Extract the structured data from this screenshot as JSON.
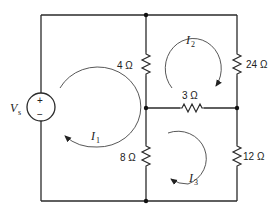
{
  "diagram": {
    "type": "circuit",
    "source": {
      "label": "V",
      "subscript": "s",
      "plus": "+",
      "minus": "−"
    },
    "resistors": [
      {
        "id": "R4",
        "label": "4 Ω",
        "branch": "left-middle-top"
      },
      {
        "id": "R24",
        "label": "24 Ω",
        "branch": "right-top"
      },
      {
        "id": "R3",
        "label": "3 Ω",
        "branch": "middle-horizontal"
      },
      {
        "id": "R8",
        "label": "8 Ω",
        "branch": "left-middle-bottom"
      },
      {
        "id": "R12",
        "label": "12 Ω",
        "branch": "right-bottom"
      }
    ],
    "loop_currents": [
      {
        "id": "I1",
        "symbol": "I",
        "subscript": "1",
        "direction": "counterclockwise"
      },
      {
        "id": "I2",
        "symbol": "I",
        "subscript": "2",
        "direction": "clockwise"
      },
      {
        "id": "I3",
        "symbol": "I",
        "subscript": "3",
        "direction": "clockwise"
      }
    ]
  }
}
